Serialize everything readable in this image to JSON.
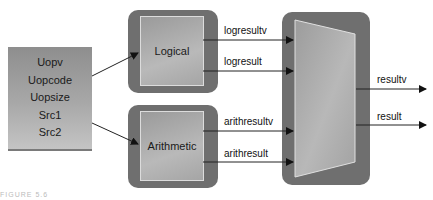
{
  "inputs": {
    "fields": [
      "Uopv",
      "Uopcode",
      "Uopsize",
      "Src1",
      "Src2"
    ]
  },
  "blocks": {
    "logical": {
      "label": "Logical",
      "outputs": [
        "logresultv",
        "logresult"
      ]
    },
    "arithmetic": {
      "label": "Arithmetic",
      "outputs": [
        "arithresultv",
        "arithresult"
      ]
    },
    "mux": {
      "outputs": [
        "resultv",
        "result"
      ]
    }
  },
  "caption": "FIGURE 5.6",
  "colors": {
    "block_outer": "#6f6f6f",
    "block_inner": "#b0b0b0",
    "input_box": "#a0a0a0",
    "arrow": "#111111",
    "inner_border": "#dcdcdc"
  }
}
